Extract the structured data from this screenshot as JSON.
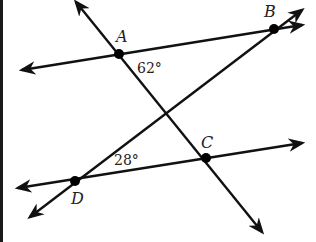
{
  "diagram": {
    "points": [
      {
        "id": "A",
        "label": "A"
      },
      {
        "id": "B",
        "label": "B"
      },
      {
        "id": "C",
        "label": "C"
      },
      {
        "id": "D",
        "label": "D"
      }
    ],
    "lines": [
      {
        "id": "line-AB",
        "through": [
          "A",
          "B"
        ]
      },
      {
        "id": "line-AC",
        "through": [
          "A",
          "C"
        ]
      },
      {
        "id": "line-DC",
        "through": [
          "D",
          "C"
        ]
      },
      {
        "id": "line-DB",
        "through": [
          "D",
          "B"
        ]
      }
    ],
    "angles": [
      {
        "id": "angle-at-A",
        "vertex": "A",
        "label": "62°"
      },
      {
        "id": "angle-at-D",
        "vertex": "D",
        "label": "28°"
      }
    ],
    "colors": {
      "stroke": "#111111",
      "point": "#000000"
    }
  }
}
